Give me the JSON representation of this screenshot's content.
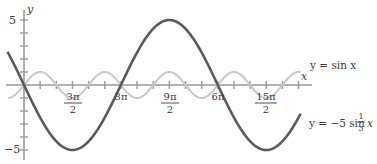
{
  "chart_data": {
    "type": "line",
    "title": "",
    "xlabel": "x",
    "ylabel": "y",
    "xlim": [
      -1.5708,
      27.3
    ],
    "ylim": [
      -5.5,
      5.5
    ],
    "grid": false,
    "x_ticks_step": "π/2",
    "x_tick_labels": [
      {
        "value": 4.7124,
        "num": "3π",
        "den": "2"
      },
      {
        "value": 9.4248,
        "text": "3π"
      },
      {
        "value": 14.1372,
        "num": "9π",
        "den": "2"
      },
      {
        "value": 18.8496,
        "text": "6π"
      },
      {
        "value": 23.5619,
        "num": "15π",
        "den": "2"
      }
    ],
    "y_ticks": [
      -5,
      -4,
      -3,
      -2,
      -1,
      0,
      1,
      2,
      3,
      4,
      5
    ],
    "y_tick_labels": [
      {
        "value": 5,
        "text": "5"
      },
      {
        "value": -5,
        "text": "−5"
      }
    ],
    "series": [
      {
        "name": "y = sin x",
        "formula": "sin(x)",
        "color": "#c8c8c8",
        "x_range": [
          -1.5708,
          26.9
        ],
        "samples": [
          [
            0,
            0
          ],
          [
            1.5708,
            1
          ],
          [
            3.1416,
            0
          ],
          [
            4.7124,
            -1
          ],
          [
            6.2832,
            0
          ],
          [
            7.854,
            1
          ],
          [
            9.4248,
            0
          ],
          [
            10.9956,
            -1
          ],
          [
            12.5664,
            0
          ],
          [
            14.1372,
            1
          ],
          [
            15.708,
            0
          ],
          [
            17.2788,
            -1
          ],
          [
            18.8496,
            0
          ],
          [
            20.4204,
            1
          ],
          [
            21.9911,
            0
          ],
          [
            23.5619,
            -1
          ],
          [
            25.1327,
            0
          ],
          [
            26.7035,
            1
          ]
        ]
      },
      {
        "name": "y = −5 sin (1/3)x",
        "formula": "-5*sin(x/3)",
        "color": "#5a5a5a",
        "x_range": [
          -1.6,
          26.9
        ],
        "samples": [
          [
            0,
            0
          ],
          [
            4.7124,
            -5
          ],
          [
            9.4248,
            0
          ],
          [
            14.1372,
            5
          ],
          [
            18.8496,
            0
          ],
          [
            23.5619,
            -5
          ]
        ]
      }
    ],
    "annotations": [
      {
        "text": "y = sin x",
        "attached_to": "y = sin x"
      },
      {
        "text": "y = −5 sin ⅓x",
        "attached_to": "y = −5 sin (1/3)x"
      }
    ]
  },
  "labels": {
    "y_axis": "y",
    "x_axis": "x",
    "y5": "5",
    "yneg5": "−5",
    "t1_num": "3π",
    "t1_den": "2",
    "t2": "3π",
    "t3_num": "9π",
    "t3_den": "2",
    "t4": "6π",
    "t5_num": "15π",
    "t5_den": "2",
    "sin_label": "y = sin x",
    "big_label_prefix": "y = −5 sin",
    "big_label_num": "1",
    "big_label_den": "3",
    "big_label_var": "x"
  }
}
